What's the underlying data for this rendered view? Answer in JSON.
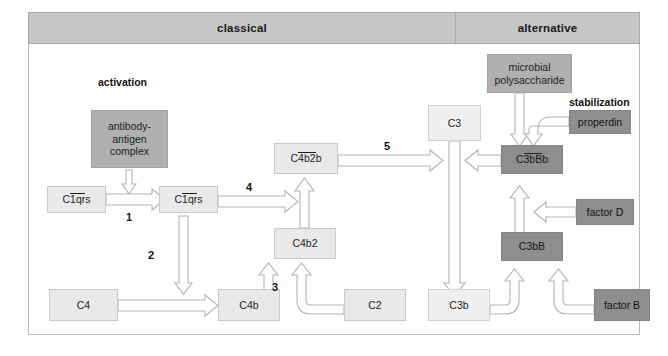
{
  "figure": {
    "type": "pathway-diagram"
  },
  "header": {
    "classical": "classical",
    "alternative": "alternative"
  },
  "labels": {
    "activation": "activation",
    "stabilization": "stabilization"
  },
  "steps": {
    "s1": "1",
    "s2": "2",
    "s3": "3",
    "s4": "4",
    "s5": "5"
  },
  "nodes": {
    "antibody_antigen": "antibody-\nantigen\ncomplex",
    "antibody_antigen_l1": "antibody-",
    "antibody_antigen_l2": "antigen",
    "antibody_antigen_l3": "complex",
    "c1qrs_inactive_pre": "C",
    "c1qrs_inactive_bar": "1qr",
    "c1qrs_inactive_post": "s",
    "c1qrs_active_pre": "C",
    "c1qrs_active_bar": "1qr",
    "c1qrs_active_post": "s",
    "c4": "C4",
    "c4b": "C4b",
    "c4b2": "C4b2",
    "c4b2b_pre": "C",
    "c4b2b_bar": "4b2",
    "c4b2b_post": "b",
    "c2": "C2",
    "c3": "C3",
    "c3b": "C3b",
    "microbial_polysaccharide_l1": "microbial",
    "microbial_polysaccharide_l2": "polysaccharide",
    "properdin": "properdin",
    "c3bbb_pre": "C",
    "c3bbb_bar": "3bB",
    "c3bbb_post": "b",
    "c3bb": "C3bB",
    "factor_d": "factor D",
    "factor_b": "factor B"
  },
  "colors": {
    "header_band": "#c6c6c6",
    "node_light": "#e9e9e9",
    "node_lighter": "#efefef",
    "node_mid": "#b0b0b0",
    "node_dark": "#8e8e8e",
    "arrow_fill": "#ffffff",
    "arrow_stroke": "#b4b4b4",
    "frame_border": "#b9b9b9",
    "text": "#1e1e1e"
  }
}
